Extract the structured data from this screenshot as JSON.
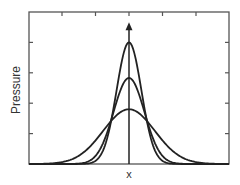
{
  "chart_data": {
    "type": "line",
    "title": "",
    "xlabel": "x",
    "ylabel": "Pressure",
    "x_tick_labels": [],
    "y_tick_labels": [],
    "xlim": [
      -3,
      3
    ],
    "ylim": [
      0,
      5
    ],
    "grid": false,
    "legend": null,
    "frame": true,
    "tick_marks": {
      "top_x": [
        -2,
        -1,
        0,
        1,
        2
      ],
      "left_y": [
        1,
        2,
        3,
        4
      ],
      "right_y": [
        1,
        2,
        3,
        4
      ]
    },
    "annotations": [
      {
        "type": "vertical-arrow",
        "x": 0,
        "from_y": 0,
        "to_y": 4.6,
        "description": "center axis line with upward arrowhead"
      }
    ],
    "series": [
      {
        "name": "narrow-peak",
        "shape": "gaussian",
        "center": 0,
        "amplitude": 4.0,
        "sigma": 0.37
      },
      {
        "name": "medium-peak",
        "shape": "gaussian",
        "center": 0,
        "amplitude": 2.83,
        "sigma": 0.46
      },
      {
        "name": "wide-peak",
        "shape": "gaussian",
        "center": 0,
        "amplitude": 1.8,
        "sigma": 0.77
      }
    ]
  },
  "labels": {
    "x": "x",
    "y": "Pressure"
  },
  "style": {
    "line_color": "#222222",
    "frame_color": "#555555"
  }
}
